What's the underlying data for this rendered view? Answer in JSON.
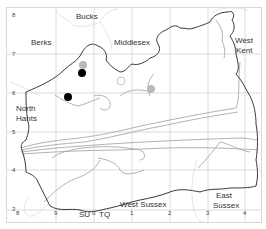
{
  "map": {
    "title": "",
    "grid_squares": {
      "left": "SU",
      "right": "TQ"
    },
    "x_ticks": [
      "8",
      "9",
      "0",
      "1",
      "2",
      "3",
      "4"
    ],
    "y_ticks": [
      "8",
      "7",
      "6",
      "5",
      "4",
      "3"
    ],
    "counties": [
      {
        "name": "Bucks",
        "lines": [
          "Bucks"
        ]
      },
      {
        "name": "Berks",
        "lines": [
          "Berks"
        ]
      },
      {
        "name": "Middlesex",
        "lines": [
          "Middlesex"
        ]
      },
      {
        "name": "West Kent",
        "lines": [
          "West",
          "Kent"
        ]
      },
      {
        "name": "North Hants",
        "lines": [
          "North",
          "Hants"
        ]
      },
      {
        "name": "West Sussex",
        "lines": [
          "West Sussex"
        ]
      },
      {
        "name": "East Sussex",
        "lines": [
          "East",
          "Sussex"
        ]
      }
    ],
    "records": [
      {
        "type": "filled-black",
        "grid_x": "SU8.8",
        "grid_y": "6.5"
      },
      {
        "type": "filled-black",
        "grid_x": "SU8.8",
        "grid_y": "5.9"
      },
      {
        "type": "filled-grey",
        "grid_x": "SU8.8",
        "grid_y": "6.6"
      },
      {
        "type": "filled-grey",
        "grid_x": "TQ1.5",
        "grid_y": "6.1"
      },
      {
        "type": "open-circle",
        "grid_x": "TQ0.6",
        "grid_y": "6.3"
      }
    ],
    "colors": {
      "boundary": "#3a3a3a",
      "grid": "#cfcfcf",
      "rivers": "#a8a8a8",
      "neighbour_boundary": "#e4e4e4",
      "dot_black": "#000000",
      "dot_grey": "#b8b8b8"
    }
  }
}
